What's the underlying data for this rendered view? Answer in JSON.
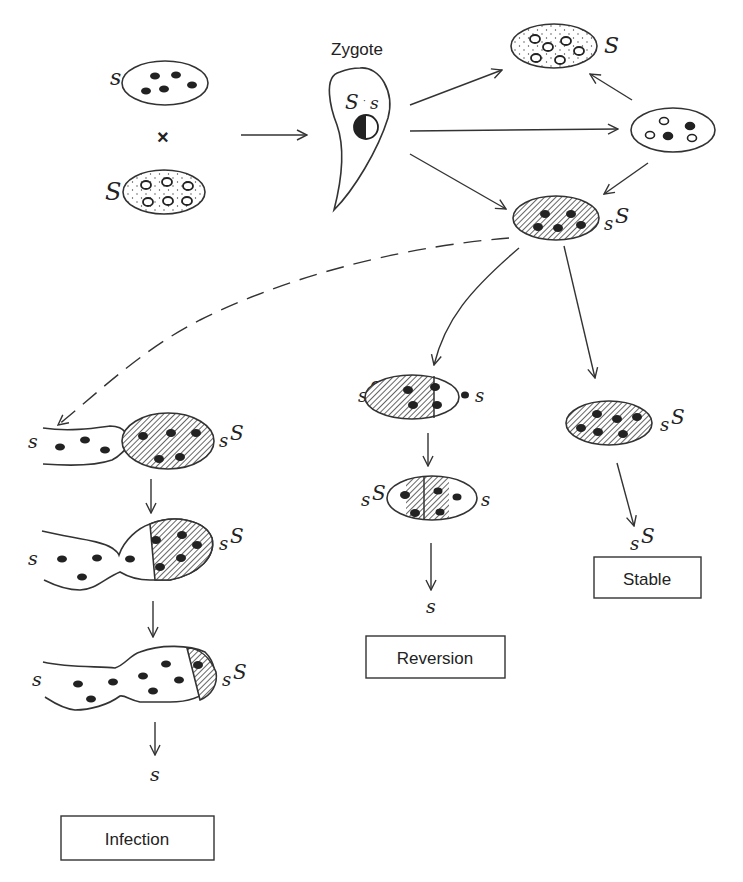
{
  "figure": {
    "type": "genetics-diagram",
    "colors": {
      "ink": "#222222",
      "background": "#ffffff"
    }
  },
  "parents": {
    "sensitive": {
      "label": "s"
    },
    "cross_symbol": "×",
    "killer": {
      "label": "S"
    }
  },
  "zygote": {
    "title": "Zygote",
    "nucleus_label_left": "S",
    "nucleus_label_dot": "·",
    "nucleus_label_right": "s"
  },
  "outcomes_top": {
    "killer_cell": {
      "label": "S"
    },
    "mixed_cell": {
      "label": ""
    },
    "heterozygous_cell": {
      "label_small": "s",
      "label_big": "S"
    }
  },
  "branches": {
    "infection": {
      "stage1": {
        "left": "s",
        "right_small": "s",
        "right_big": "S"
      },
      "stage2": {
        "left": "s",
        "right_small": "s",
        "right_big": "S"
      },
      "stage3": {
        "left": "s",
        "right_small": "s",
        "right_big": "S"
      },
      "result": "s",
      "box_label": "Infection"
    },
    "reversion": {
      "stage1": {
        "left_small": "s",
        "left_big": "S",
        "right": "s"
      },
      "stage2": {
        "left_small": "s",
        "left_big": "S",
        "right": "s"
      },
      "result": "s",
      "box_label": "Reversion"
    },
    "stable": {
      "stage1": {
        "right_small": "s",
        "right_big": "S"
      },
      "result_small": "s",
      "result_big": "S",
      "box_label": "Stable"
    }
  }
}
